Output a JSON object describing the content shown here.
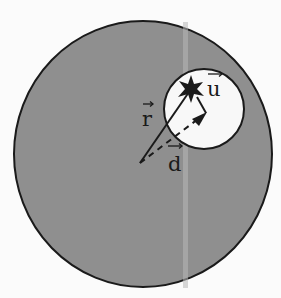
{
  "diagram": {
    "colors": {
      "background": "#fbfbfb",
      "sphere_fill": "#8f8f8f",
      "cavity_fill": "#f8f8f8",
      "stroke": "#1a1a1a",
      "scan_stripe": "#b8b8b8"
    },
    "large_sphere": {
      "cx": 143,
      "cy": 154,
      "rx": 129,
      "ry": 133
    },
    "cavity": {
      "cx": 204,
      "cy": 109,
      "r": 40
    },
    "origin": {
      "x": 140,
      "y": 163
    },
    "point_star": {
      "x": 191,
      "y": 89
    },
    "d_tip": {
      "x": 206,
      "y": 113
    },
    "labels": {
      "r": "r",
      "d": "d",
      "u": "u"
    }
  }
}
